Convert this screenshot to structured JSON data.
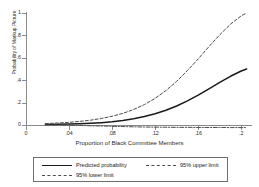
{
  "chart_data": {
    "type": "line",
    "title": "",
    "xlabel": "Proportion of Black Committee Members",
    "ylabel": "Probability of Markup Picture",
    "xlim": [
      0,
      0.21
    ],
    "ylim": [
      0,
      1
    ],
    "grid": false,
    "legend_position": "bottom",
    "xticks": [
      "0",
      ".04",
      ".08",
      ".12",
      ".16",
      ".2"
    ],
    "xtick_values": [
      0,
      0.04,
      0.08,
      0.12,
      0.16,
      0.2
    ],
    "yticks": [
      "0",
      ".2",
      ".4",
      ".6",
      ".8",
      "1"
    ],
    "ytick_values": [
      0,
      0.2,
      0.4,
      0.6,
      0.8,
      1
    ],
    "x": [
      0.018,
      0.03,
      0.04,
      0.05,
      0.06,
      0.07,
      0.08,
      0.09,
      0.1,
      0.11,
      0.12,
      0.13,
      0.14,
      0.15,
      0.16,
      0.17,
      0.18,
      0.19,
      0.2,
      0.205
    ],
    "series": [
      {
        "name": "Predicted probability",
        "style": "solid",
        "color": "#1a1a1a",
        "values": [
          0.004,
          0.006,
          0.008,
          0.011,
          0.015,
          0.021,
          0.029,
          0.04,
          0.055,
          0.075,
          0.1,
          0.132,
          0.17,
          0.215,
          0.266,
          0.322,
          0.38,
          0.435,
          0.482,
          0.5
        ]
      },
      {
        "name": "95% upper limit",
        "style": "dashed",
        "color": "#4d4d4d",
        "values": [
          0.012,
          0.018,
          0.024,
          0.032,
          0.043,
          0.058,
          0.078,
          0.104,
          0.138,
          0.182,
          0.238,
          0.307,
          0.39,
          0.486,
          0.59,
          0.7,
          0.805,
          0.9,
          0.975,
          1.0
        ]
      },
      {
        "name": "95% lower limit",
        "style": "dashdot",
        "color": "#4d4d4d",
        "values": [
          0.001,
          0.0,
          -0.002,
          -0.004,
          -0.007,
          -0.009,
          -0.012,
          -0.014,
          -0.016,
          -0.018,
          -0.019,
          -0.02,
          -0.021,
          -0.021,
          -0.022,
          -0.022,
          -0.022,
          -0.023,
          -0.023,
          -0.023
        ]
      }
    ],
    "legend_entries": [
      {
        "label": "Predicted probability",
        "style": "solid"
      },
      {
        "label": "95% upper limit",
        "style": "dashed"
      },
      {
        "label": "95% lower limit",
        "style": "dashdot"
      }
    ]
  }
}
